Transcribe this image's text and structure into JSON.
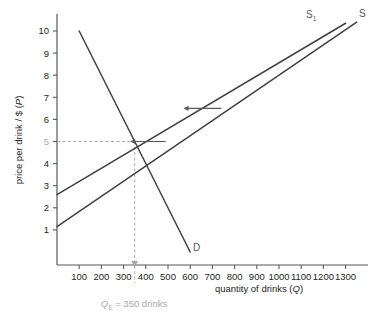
{
  "chart_data": {
    "type": "line",
    "title": "",
    "xlabel": "quantity of drinks (Q)",
    "ylabel": "price per drink / $ (P)",
    "xlim": [
      0,
      1350
    ],
    "ylim": [
      0,
      10.6
    ],
    "grid": false,
    "legend_position": "inline-curve-labels",
    "xticks": [
      100,
      200,
      300,
      400,
      500,
      600,
      700,
      800,
      900,
      1000,
      1100,
      1200,
      1300
    ],
    "yticks": [
      1,
      2,
      3,
      4,
      5,
      6,
      7,
      8,
      9,
      10
    ],
    "xtick_labels": [
      "100",
      "200",
      "300",
      "400",
      "500",
      "600",
      "700",
      "800",
      "900",
      "1000",
      "1100",
      "1200",
      "1300"
    ],
    "ytick_labels": [
      "1",
      "2",
      "3",
      "4",
      "5",
      "6",
      "7",
      "8",
      "9",
      "10"
    ],
    "highlighted_ytick": "5",
    "series": [
      {
        "name": "D",
        "label": "D",
        "role": "demand",
        "color": "#404041",
        "points": [
          [
            100,
            10.0
          ],
          [
            600,
            0.0
          ]
        ]
      },
      {
        "name": "S1",
        "label": "S",
        "label_sub": "1",
        "role": "supply-shifted",
        "color": "#404041",
        "points": [
          [
            0,
            2.6
          ],
          [
            1300,
            10.35
          ]
        ]
      },
      {
        "name": "S",
        "label": "S",
        "label_sub": "",
        "role": "supply-original",
        "color": "#404041",
        "points": [
          [
            0,
            1.15
          ],
          [
            1350,
            10.4
          ]
        ]
      }
    ],
    "equilibrium": {
      "q": 350,
      "p": 5,
      "note": "Q",
      "note_sub": "E",
      "note_rest": " = 350 drinks",
      "guide_color": "#a7a9ac"
    },
    "annotations": [
      {
        "kind": "arrow",
        "name": "supply-shift-arrow-upper",
        "direction": "left",
        "from": [
          740,
          6.5
        ],
        "to": [
          570,
          6.5
        ]
      },
      {
        "kind": "arrow",
        "name": "supply-shift-arrow-lower",
        "direction": "left",
        "from": [
          490,
          5.0
        ],
        "to": [
          330,
          5.0
        ]
      }
    ]
  }
}
